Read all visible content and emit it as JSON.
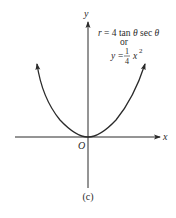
{
  "figure": {
    "caption": "(c)",
    "axes": {
      "x_label": "x",
      "y_label": "y",
      "origin_label": "O"
    },
    "equations": {
      "polar": {
        "lhs": "r",
        "eq": "= 4 tan",
        "theta1": "θ",
        "sec": "sec",
        "theta2": "θ"
      },
      "connector": "or",
      "cartesian": {
        "lhs": "y",
        "eq": "=",
        "frac_num": "1",
        "frac_den": "4",
        "var": "x",
        "exp": "2"
      }
    },
    "curve": {
      "type": "parabola",
      "equation": "y = (1/4) x^2",
      "vertex": "origin",
      "opens": "up",
      "arrows_at_ends": true
    },
    "colors": {
      "ink": "#2a2a2a",
      "background": "#ffffff"
    }
  }
}
